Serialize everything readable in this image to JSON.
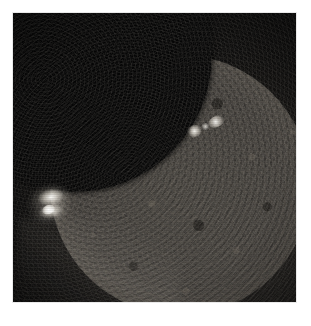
{
  "page": {
    "background_color": "#ffffff",
    "width": 311,
    "height": 326
  },
  "image": {
    "alt_text": "Solar eclipse observed in extreme ultraviolet: a dark lunar disk occults the upper-left portion of the Sun, leaving a bright crescent of solar disk and limb across the lower right.",
    "subject": "partial solar eclipse",
    "frame": {
      "left": 13,
      "top": 13,
      "width": 283,
      "height": 289,
      "border_color": "#e9e9e9"
    },
    "palette": {
      "background_black": "#090909",
      "occulting_disk": "#050505",
      "solar_disk_mid": "#46433f",
      "solar_disk_bright_limb": "#ece6da",
      "flare_core": "#fffffc",
      "corona_haze": "#605a52"
    },
    "features": [
      {
        "id": "occulting-disk",
        "name": "occulting lunar disk",
        "center_x": 75,
        "center_y": 55,
        "radius": 137,
        "brightness": "black"
      },
      {
        "id": "solar-disk",
        "name": "solar disk",
        "center_x": 180,
        "center_y": 185,
        "radius": 130,
        "brightness": "mottled dark gray"
      },
      {
        "id": "limb-rim",
        "name": "bright solar limb",
        "brightness": "bright white-gray arc",
        "position": "right and lower-right edge"
      },
      {
        "id": "active-region-a",
        "name": "active region bright point",
        "center_x": 194,
        "center_y": 132,
        "brightness": "very bright"
      },
      {
        "id": "active-region-b",
        "name": "active region bright point",
        "center_x": 215,
        "center_y": 122,
        "brightness": "very bright"
      },
      {
        "id": "limb-flare",
        "name": "limb flare / prominence",
        "center_x": 47,
        "center_y": 200,
        "brightness": "brightest feature"
      },
      {
        "id": "corona-streamer",
        "name": "faint coronal streamer",
        "position": "lower-left, outside the limb",
        "brightness": "faint haze"
      }
    ]
  },
  "caption": {
    "text": ""
  }
}
